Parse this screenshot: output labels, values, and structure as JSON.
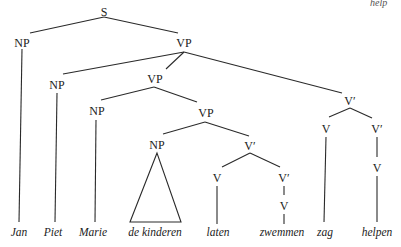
{
  "corner_text": "help",
  "tree": {
    "nodes": {
      "S": {
        "label": "S",
        "x": 104,
        "y": 12
      },
      "NP1": {
        "label": "NP",
        "x": 22,
        "y": 43
      },
      "VP1": {
        "label": "VP",
        "x": 184,
        "y": 43
      },
      "NP2": {
        "label": "NP",
        "x": 57,
        "y": 84
      },
      "VP2": {
        "label": "VP",
        "x": 155,
        "y": 79
      },
      "Vbar1": {
        "label": "V′",
        "x": 350,
        "y": 101
      },
      "NP3": {
        "label": "NP",
        "x": 97,
        "y": 111
      },
      "VP3": {
        "label": "VP",
        "x": 206,
        "y": 113
      },
      "V_zag": {
        "label": "V",
        "x": 326,
        "y": 129
      },
      "Vbar2": {
        "label": "V′",
        "x": 377,
        "y": 129
      },
      "NP4": {
        "label": "NP",
        "x": 157,
        "y": 145
      },
      "Vbar3": {
        "label": "V′",
        "x": 250,
        "y": 146
      },
      "V_helpen": {
        "label": "V",
        "x": 377,
        "y": 168
      },
      "V_laten": {
        "label": "V",
        "x": 217,
        "y": 178
      },
      "Vbar4": {
        "label": "V′",
        "x": 284,
        "y": 178
      },
      "V_zwem": {
        "label": "V",
        "x": 284,
        "y": 206
      }
    },
    "leaves": [
      {
        "id": "w_jan",
        "text": "Jan",
        "x": 19,
        "y": 236
      },
      {
        "id": "w_piet",
        "text": "Piet",
        "x": 52,
        "y": 236
      },
      {
        "id": "w_marie",
        "text": "Marie",
        "x": 92,
        "y": 236
      },
      {
        "id": "w_kind",
        "text": "de kinderen",
        "x": 154,
        "y": 236
      },
      {
        "id": "w_laten",
        "text": "laten",
        "x": 218,
        "y": 236
      },
      {
        "id": "w_zwemmen",
        "text": "zwemmen",
        "x": 282,
        "y": 236
      },
      {
        "id": "w_zag",
        "text": "zag",
        "x": 325,
        "y": 236
      },
      {
        "id": "w_helpen",
        "text": "helpen",
        "x": 377,
        "y": 236
      }
    ],
    "edges": [
      [
        "S",
        "NP1"
      ],
      [
        "S",
        "VP1"
      ],
      [
        "VP1",
        "NP2"
      ],
      [
        "VP1",
        "VP2"
      ],
      [
        "VP1",
        "Vbar1"
      ],
      [
        "VP2",
        "NP3"
      ],
      [
        "VP2",
        "VP3"
      ],
      [
        "VP3",
        "NP4"
      ],
      [
        "VP3",
        "Vbar3"
      ],
      [
        "Vbar3",
        "V_laten"
      ],
      [
        "Vbar3",
        "Vbar4"
      ],
      [
        "Vbar4",
        "V_zwem"
      ],
      [
        "Vbar1",
        "V_zag"
      ],
      [
        "Vbar1",
        "Vbar2"
      ],
      [
        "Vbar2",
        "V_helpen"
      ]
    ],
    "triangle": {
      "node": "NP4",
      "covers": "de kinderen"
    }
  }
}
